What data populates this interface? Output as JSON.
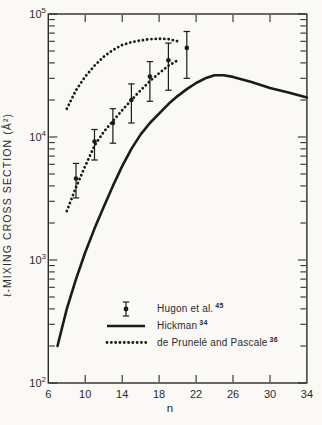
{
  "figure": {
    "background": "#faf9f5",
    "ink": "#2b2b2b",
    "curve_color": "#1b1b1b"
  },
  "chart_data": {
    "type": "line",
    "title": "",
    "xlabel": "n",
    "ylabel": "ℓ-MIXING CROSS SECTION (Å²)",
    "grid": false,
    "legend_position": "inside lower right",
    "x_axis": {
      "min": 6,
      "max": 34,
      "ticks": [
        6,
        10,
        14,
        18,
        22,
        26,
        30,
        34
      ],
      "tick_labels": [
        "6",
        "10",
        "14",
        "18",
        "22",
        "26",
        "30",
        "34"
      ]
    },
    "y_axis": {
      "scale": "log",
      "min": 100,
      "max": 100000,
      "ticks": [
        100,
        1000,
        10000,
        100000
      ],
      "tick_labels": [
        "10²",
        "10³",
        "10⁴",
        "10⁵"
      ],
      "minor_ticks": "2-9 per decade"
    },
    "series": [
      {
        "name": "Hugon et al.",
        "ref": "45",
        "style": "points_with_error_bars",
        "points": [
          {
            "n": 9,
            "sigma": 4600,
            "lo": 3200,
            "hi": 6100
          },
          {
            "n": 11,
            "sigma": 9200,
            "lo": 6500,
            "hi": 11500
          },
          {
            "n": 13,
            "sigma": 13000,
            "lo": 8900,
            "hi": 17000
          },
          {
            "n": 15,
            "sigma": 20000,
            "lo": 13000,
            "hi": 27000
          },
          {
            "n": 17,
            "sigma": 31000,
            "lo": 19500,
            "hi": 41000
          },
          {
            "n": 19,
            "sigma": 42000,
            "lo": 24000,
            "hi": 58000
          },
          {
            "n": 21,
            "sigma": 53000,
            "lo": 30000,
            "hi": 72000
          }
        ]
      },
      {
        "name": "Hickman",
        "ref": "34",
        "style": "solid_line",
        "points": [
          [
            7,
            200
          ],
          [
            8,
            400
          ],
          [
            9,
            700
          ],
          [
            10,
            1150
          ],
          [
            11,
            1800
          ],
          [
            12,
            2700
          ],
          [
            13,
            4000
          ],
          [
            14,
            5800
          ],
          [
            15,
            8000
          ],
          [
            16,
            10500
          ],
          [
            17,
            13000
          ],
          [
            18,
            15500
          ],
          [
            19,
            18500
          ],
          [
            20,
            21500
          ],
          [
            21,
            24500
          ],
          [
            22,
            27500
          ],
          [
            23,
            30000
          ],
          [
            24,
            31800
          ],
          [
            25,
            31800
          ],
          [
            26,
            30800
          ],
          [
            28,
            28000
          ],
          [
            30,
            25000
          ],
          [
            32,
            23000
          ],
          [
            34,
            21000
          ]
        ]
      },
      {
        "name": "de Prunelé and Pascale",
        "ref": "36",
        "style": "dotted_line",
        "curves": [
          {
            "label": "upper",
            "points": [
              [
                8,
                17000
              ],
              [
                9,
                24000
              ],
              [
                10,
                31000
              ],
              [
                11,
                38000
              ],
              [
                12,
                45000
              ],
              [
                13,
                51000
              ],
              [
                14,
                56000
              ],
              [
                15,
                59000
              ],
              [
                16,
                61000
              ],
              [
                17,
                62500
              ],
              [
                18,
                63000
              ],
              [
                19,
                62500
              ],
              [
                20,
                60000
              ]
            ]
          },
          {
            "label": "lower",
            "points": [
              [
                8,
                2500
              ],
              [
                9,
                3900
              ],
              [
                10,
                5800
              ],
              [
                11,
                8500
              ],
              [
                12,
                11000
              ],
              [
                13,
                13500
              ],
              [
                14,
                16500
              ],
              [
                15,
                20000
              ],
              [
                16,
                24000
              ],
              [
                17,
                28500
              ],
              [
                18,
                33000
              ],
              [
                19,
                38000
              ],
              [
                20,
                42000
              ]
            ]
          }
        ]
      }
    ]
  }
}
